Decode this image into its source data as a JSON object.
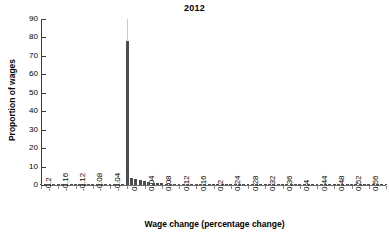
{
  "chart_data": {
    "type": "bar",
    "title": "2012",
    "xlabel": "Wage change (percentage change)",
    "ylabel": "Proportion of wages",
    "ylim": [
      0,
      90
    ],
    "xlim": [
      -0.2,
      0.6
    ],
    "grid": false,
    "legend": null,
    "ytick_labels": [
      "0",
      "10",
      "20",
      "30",
      "40",
      "50",
      "60",
      "70",
      "80",
      "90"
    ],
    "ytick_values": [
      0,
      10,
      20,
      30,
      40,
      50,
      60,
      70,
      80,
      90
    ],
    "xtick_labels": [
      "-0.2",
      "-0.16",
      "-0.12",
      "-0.08",
      "-0.04",
      "0",
      "0.04",
      "0.08",
      "0.12",
      "0.16",
      "0.2",
      "0.24",
      "0.28",
      "0.32",
      "0.36",
      "0.4",
      "0.44",
      "0.48",
      "0.52",
      "0.56",
      "0.6"
    ],
    "xtick_values": [
      -0.2,
      -0.16,
      -0.12,
      -0.08,
      -0.04,
      0,
      0.04,
      0.08,
      0.12,
      0.16,
      0.2,
      0.24,
      0.28,
      0.32,
      0.36,
      0.4,
      0.44,
      0.48,
      0.52,
      0.56,
      0.6
    ],
    "bar_color": "#4d4d4d",
    "spike_extension_color": "#c9c9c9",
    "spike_extension_top": 90,
    "x": [
      -0.2,
      -0.19,
      -0.18,
      -0.17,
      -0.16,
      -0.15,
      -0.14,
      -0.13,
      -0.12,
      -0.11,
      -0.1,
      -0.09,
      -0.08,
      -0.07,
      -0.06,
      -0.05,
      -0.04,
      -0.03,
      -0.02,
      -0.01,
      0,
      0.01,
      0.02,
      0.03,
      0.04,
      0.05,
      0.06,
      0.07,
      0.08,
      0.09,
      0.1,
      0.11,
      0.12,
      0.13,
      0.14,
      0.15,
      0.16,
      0.17,
      0.18,
      0.19,
      0.2,
      0.21,
      0.22,
      0.23,
      0.24,
      0.25,
      0.26,
      0.27,
      0.28,
      0.29,
      0.3,
      0.31,
      0.32,
      0.33,
      0.34,
      0.35,
      0.36,
      0.37,
      0.38,
      0.39,
      0.4,
      0.41,
      0.42,
      0.43,
      0.44,
      0.45,
      0.46,
      0.47,
      0.48,
      0.49,
      0.5,
      0.51,
      0.52,
      0.53,
      0.54,
      0.55,
      0.56,
      0.57,
      0.58,
      0.59,
      0.6
    ],
    "values": [
      0.5,
      0.1,
      0.1,
      0.1,
      0.15,
      0.1,
      0.1,
      0.1,
      0.2,
      0.1,
      0.1,
      0.15,
      0.25,
      0.1,
      0.15,
      0.15,
      0.3,
      0.15,
      0.2,
      0.4,
      78,
      4.0,
      3.2,
      2.6,
      2.0,
      1.6,
      1.3,
      1.1,
      0.95,
      0.8,
      0.7,
      0.62,
      0.55,
      0.48,
      0.42,
      0.38,
      0.34,
      0.3,
      0.27,
      0.24,
      0.22,
      0.2,
      0.18,
      0.16,
      0.15,
      0.14,
      0.13,
      0.12,
      0.11,
      0.1,
      0.1,
      0.09,
      0.09,
      0.08,
      0.08,
      0.07,
      0.07,
      0.06,
      0.06,
      0.06,
      0.05,
      0.05,
      0.05,
      0.04,
      0.04,
      0.04,
      0.04,
      0.03,
      0.03,
      0.03,
      0.03,
      0.03,
      0.02,
      0.02,
      0.02,
      0.02,
      0.02,
      0.02,
      0.02,
      0.02,
      0.02
    ],
    "annotations": [
      {
        "text": "spike at zero truncated by thin line reaching 90",
        "x": 0,
        "y": 90
      }
    ]
  }
}
